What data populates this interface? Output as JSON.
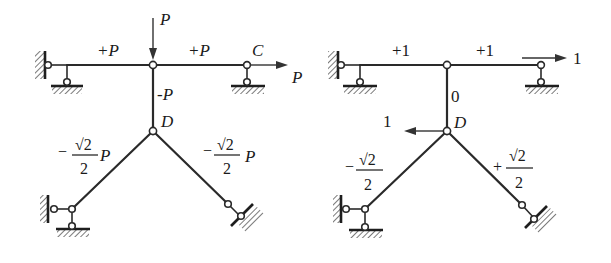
{
  "diagrams": [
    {
      "id": "left",
      "title": "Actual load truss (forces)",
      "labels": {
        "load_top": "P",
        "member_left_top": "+P",
        "member_right_top": "+P",
        "joint_c": "C",
        "load_right": "P",
        "member_vertical": "-P",
        "joint_d": "D",
        "diag_left_sign": "−",
        "diag_left_num": "√2",
        "diag_left_den": "2",
        "diag_left_suffix": "P",
        "diag_right_sign": "−",
        "diag_right_num": "√2",
        "diag_right_den": "2",
        "diag_right_suffix": "P"
      }
    },
    {
      "id": "right",
      "title": "Unit load truss (forces)",
      "labels": {
        "member_left_top": "+1",
        "member_right_top": "+1",
        "load_right": "1",
        "member_vertical": "0",
        "joint_d": "D",
        "load_d": "1",
        "diag_left_sign": "−",
        "diag_left_num": "√2",
        "diag_left_den": "2",
        "diag_right_sign": "+",
        "diag_right_num": "√2",
        "diag_right_den": "2"
      }
    }
  ],
  "colors": {
    "line": "#2a2a2a",
    "background": "#ffffff"
  }
}
